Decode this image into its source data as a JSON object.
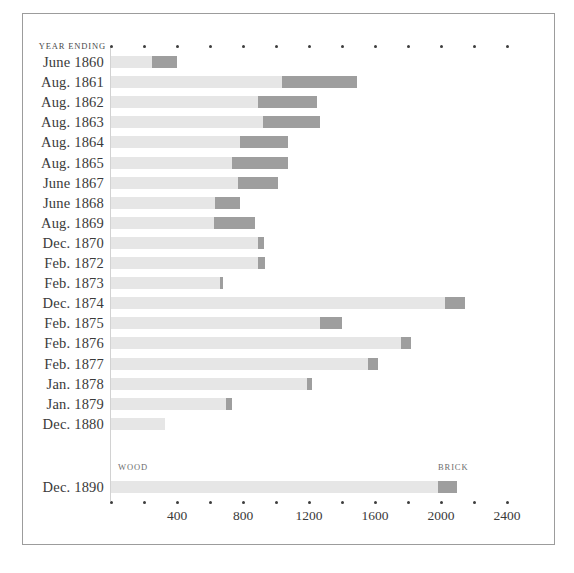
{
  "frame": {
    "visible": true
  },
  "header": {
    "row_header": "YEAR ENDING"
  },
  "legend": {
    "wood": "WOOD",
    "brick": "BRICK"
  },
  "colors": {
    "wood": "#e6e6e6",
    "brick": "#9e9e9e",
    "text": "#3a3a3a",
    "axis": "#d2d2d2",
    "frame": "#9c9c9c",
    "background": "#ffffff"
  },
  "chart_data": {
    "type": "bar",
    "orientation": "horizontal",
    "stacked": true,
    "title": "",
    "subtitle": "",
    "xlabel": "",
    "ylabel": "YEAR ENDING",
    "xlim": [
      0,
      2500
    ],
    "grid": false,
    "legend_position": "inline-bottom",
    "axis_ticks": [
      0,
      200,
      400,
      600,
      800,
      1000,
      1200,
      1400,
      1600,
      1800,
      2000,
      2200,
      2400
    ],
    "tick_labels": [
      "",
      "",
      "400",
      "",
      "800",
      "",
      "1200",
      "",
      "1600",
      "",
      "2000",
      "",
      "2400"
    ],
    "categories": [
      "June 1860",
      "Aug. 1861",
      "Aug. 1862",
      "Aug. 1863",
      "Aug. 1864",
      "Aug. 1865",
      "June 1867",
      "June 1868",
      "Aug. 1869",
      "Dec. 1870",
      "Feb. 1872",
      "Feb. 1873",
      "Dec. 1874",
      "Feb. 1875",
      "Feb. 1876",
      "Feb. 1877",
      "Jan. 1878",
      "Jan. 1879",
      "Dec. 1880",
      "Dec. 1890"
    ],
    "series": [
      {
        "name": "WOOD",
        "color": "#e6e6e6",
        "values": [
          250,
          1036,
          891,
          921,
          782,
          733,
          770,
          630,
          624,
          891,
          891,
          660,
          2024,
          1267,
          1758,
          1558,
          1188,
          697,
          327,
          1982
        ]
      },
      {
        "name": "BRICK",
        "color": "#9e9e9e",
        "values": [
          150,
          454,
          357,
          346,
          291,
          340,
          242,
          150,
          249,
          36,
          42,
          18,
          121,
          133,
          60,
          61,
          30,
          36,
          0,
          115
        ]
      }
    ],
    "totals": [
      400,
      1490,
      1248,
      1267,
      1073,
      1073,
      1012,
      780,
      873,
      927,
      933,
      678,
      2145,
      1400,
      1818,
      1619,
      1218,
      733,
      327,
      2097
    ]
  },
  "rows": [
    {
      "label": "June 1860",
      "wood": 250,
      "brick": 150,
      "total": 400
    },
    {
      "label": "Aug. 1861",
      "wood": 1036,
      "brick": 454,
      "total": 1490
    },
    {
      "label": "Aug. 1862",
      "wood": 891,
      "brick": 357,
      "total": 1248
    },
    {
      "label": "Aug. 1863",
      "wood": 921,
      "brick": 346,
      "total": 1267
    },
    {
      "label": "Aug. 1864",
      "wood": 782,
      "brick": 291,
      "total": 1073
    },
    {
      "label": "Aug. 1865",
      "wood": 733,
      "brick": 340,
      "total": 1073
    },
    {
      "label": "June 1867",
      "wood": 770,
      "brick": 242,
      "total": 1012
    },
    {
      "label": "June 1868",
      "wood": 630,
      "brick": 150,
      "total": 780
    },
    {
      "label": "Aug. 1869",
      "wood": 624,
      "brick": 249,
      "total": 873
    },
    {
      "label": "Dec. 1870",
      "wood": 891,
      "brick": 36,
      "total": 927
    },
    {
      "label": "Feb. 1872",
      "wood": 891,
      "brick": 42,
      "total": 933
    },
    {
      "label": "Feb. 1873",
      "wood": 660,
      "brick": 18,
      "total": 678
    },
    {
      "label": "Dec. 1874",
      "wood": 2024,
      "brick": 121,
      "total": 2145
    },
    {
      "label": "Feb. 1875",
      "wood": 1267,
      "brick": 133,
      "total": 1400
    },
    {
      "label": "Feb. 1876",
      "wood": 1758,
      "brick": 60,
      "total": 1818
    },
    {
      "label": "Feb. 1877",
      "wood": 1558,
      "brick": 61,
      "total": 1619
    },
    {
      "label": "Jan. 1878",
      "wood": 1188,
      "brick": 30,
      "total": 1218
    },
    {
      "label": "Jan. 1879",
      "wood": 697,
      "brick": 36,
      "total": 733
    },
    {
      "label": "Dec. 1880",
      "wood": 327,
      "brick": 0,
      "total": 327
    },
    {
      "label": "Dec. 1890",
      "wood": 1982,
      "brick": 115,
      "total": 2097
    }
  ]
}
